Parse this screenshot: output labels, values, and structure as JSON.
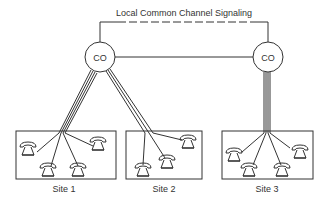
{
  "diagram": {
    "signaling_label": "Local Common Channel Signaling",
    "nodes": [
      {
        "id": "co-left",
        "label": "CO"
      },
      {
        "id": "co-right",
        "label": "CO"
      }
    ],
    "sites": [
      {
        "label": "Site 1",
        "phones": 4,
        "lines": 4
      },
      {
        "label": "Site 2",
        "phones": 3,
        "lines": 3
      },
      {
        "label": "Site 3",
        "phones": 4,
        "lines": 4
      }
    ],
    "colors": {
      "stroke": "#333333",
      "background": "#ffffff"
    }
  }
}
